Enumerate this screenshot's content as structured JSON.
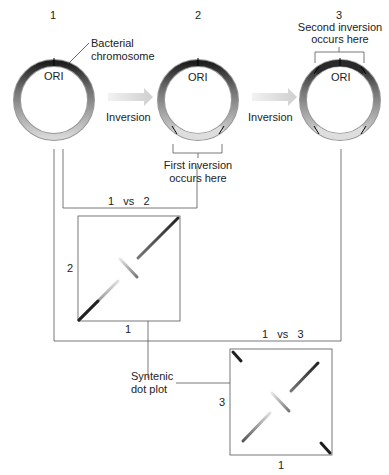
{
  "stages": [
    {
      "number": "1",
      "ori_label": "ORI"
    },
    {
      "number": "2",
      "ori_label": "ORI"
    },
    {
      "number": "3",
      "ori_label": "ORI"
    }
  ],
  "labels": {
    "bacterial_chromosome_line1": "Bacterial",
    "bacterial_chromosome_line2": "chromosome",
    "inversion_1": "Inversion",
    "inversion_2": "Inversion",
    "first_inversion_line1": "First inversion",
    "first_inversion_line2": "occurs here",
    "second_inversion_line1": "Second inversion",
    "second_inversion_line2": "occurs here",
    "comparison_1": "1   vs   2",
    "comparison_2": "1   vs   3",
    "syntenic_line1": "Syntenic",
    "syntenic_line2": "dot plot"
  },
  "dot_plots": [
    {
      "x_axis": "1",
      "y_axis": "2"
    },
    {
      "x_axis": "1",
      "y_axis": "3"
    }
  ],
  "colors": {
    "ring_dark": "#2a2a2a",
    "ring_mid": "#8a8a8a",
    "ring_light": "#d4d4d4",
    "line": "#555555",
    "arrow": "#d8d8d8"
  }
}
